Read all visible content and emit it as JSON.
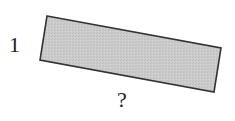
{
  "diagram": {
    "shape": "rotated-rectangle",
    "fill_color": "#c8c8c8",
    "stroke_color": "#333333",
    "corners": [
      [
        47,
        16
      ],
      [
        221,
        48
      ],
      [
        214,
        92
      ],
      [
        40,
        60
      ]
    ],
    "labels": {
      "short_side": "1",
      "long_side": "?"
    }
  }
}
